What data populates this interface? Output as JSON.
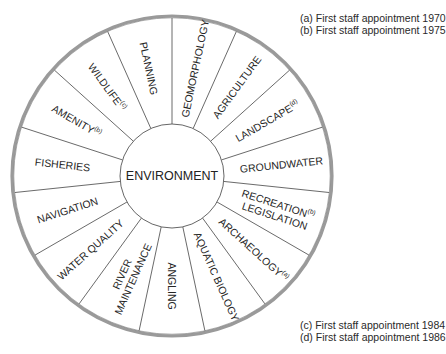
{
  "diagram": {
    "center_label": "ENVIRONMENT",
    "center": [
      172,
      176
    ],
    "outer_radius": 160,
    "inner_radius": 52,
    "segments": [
      {
        "label": "GEOMORPHOLOGY",
        "note": ""
      },
      {
        "label": "AGRICULTURE",
        "note": ""
      },
      {
        "label": "LANDSCAPE",
        "note": "(d)"
      },
      {
        "label": "GROUNDWATER",
        "note": ""
      },
      {
        "label": "RECREATION",
        "label2": "LEGISLATION",
        "note": "(b)"
      },
      {
        "label": "ARCHAEOLOGY",
        "note": "(a)"
      },
      {
        "label": "AQUATIC BIOLOGY",
        "note": ""
      },
      {
        "label": "ANGLING",
        "note": ""
      },
      {
        "label": "RIVER",
        "label2": "MAINTENANCE",
        "note": ""
      },
      {
        "label": "WATER QUALITY",
        "note": ""
      },
      {
        "label": "NAVIGATION",
        "note": ""
      },
      {
        "label": "FISHERIES",
        "note": ""
      },
      {
        "label": "AMENITY",
        "note": "(b)"
      },
      {
        "label": "WILDLIFE",
        "note": "(c)"
      },
      {
        "label": "PLANNING",
        "note": ""
      }
    ],
    "colors": {
      "ring": "#9a9a9a",
      "spoke": "#444444",
      "text": "#262626"
    }
  },
  "legend": {
    "top": [
      "(a) First staff appointment 1970",
      "(b) First staff appointment 1975"
    ],
    "bottom": [
      "(c) First staff appointment 1984",
      "(d) First staff appointment 1986"
    ]
  }
}
